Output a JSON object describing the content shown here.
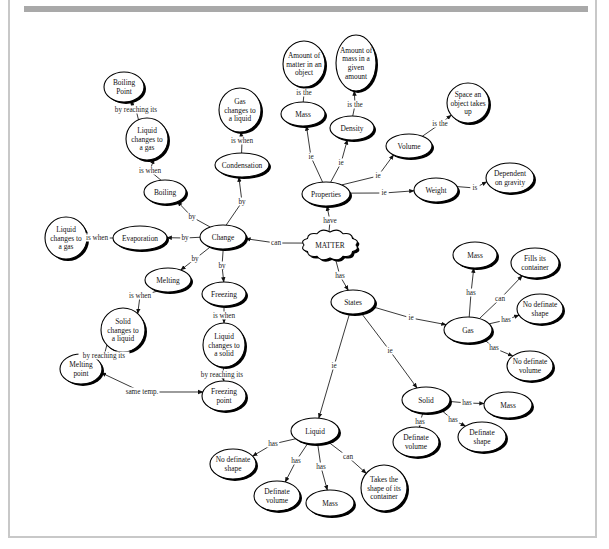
{
  "colors": {
    "frame": "#c8c8c8",
    "topbar": "#a9a9a9",
    "ink": "#111111"
  },
  "nodes": [
    {
      "id": "matter",
      "label": [
        "MATTER"
      ],
      "x": 330,
      "y": 245,
      "rx": 26,
      "ry": 13,
      "shape": "cloud"
    },
    {
      "id": "properties",
      "label": [
        "Properties"
      ],
      "x": 326,
      "y": 194,
      "rx": 24,
      "ry": 12
    },
    {
      "id": "mass_p",
      "label": [
        "Mass"
      ],
      "x": 303,
      "y": 114,
      "rx": 22,
      "ry": 12
    },
    {
      "id": "mass_def",
      "label": [
        "Amount of",
        "matter in an",
        "object"
      ],
      "x": 304,
      "y": 64,
      "rx": 21,
      "ry": 23
    },
    {
      "id": "density",
      "label": [
        "Density"
      ],
      "x": 352,
      "y": 128,
      "rx": 22,
      "ry": 12
    },
    {
      "id": "density_def",
      "label": [
        "Amount of",
        "mass in a",
        "given",
        "amount"
      ],
      "x": 356,
      "y": 63,
      "rx": 20,
      "ry": 28
    },
    {
      "id": "volume",
      "label": [
        "Volume"
      ],
      "x": 409,
      "y": 146,
      "rx": 23,
      "ry": 12
    },
    {
      "id": "volume_def",
      "label": [
        "Space an",
        "object takes",
        "up"
      ],
      "x": 468,
      "y": 103,
      "rx": 21,
      "ry": 20
    },
    {
      "id": "weight",
      "label": [
        "Weight"
      ],
      "x": 436,
      "y": 190,
      "rx": 22,
      "ry": 12
    },
    {
      "id": "weight_def",
      "label": [
        "Dependent",
        "on gravity"
      ],
      "x": 510,
      "y": 178,
      "rx": 24,
      "ry": 15
    },
    {
      "id": "change",
      "label": [
        "Change"
      ],
      "x": 223,
      "y": 237,
      "rx": 23,
      "ry": 12
    },
    {
      "id": "condensation",
      "label": [
        "Condensation"
      ],
      "x": 242,
      "y": 165,
      "rx": 27,
      "ry": 12
    },
    {
      "id": "cond_def",
      "label": [
        "Gas",
        "changes to",
        "a liquid"
      ],
      "x": 240,
      "y": 110,
      "rx": 21,
      "ry": 22
    },
    {
      "id": "boiling",
      "label": [
        "Boiling"
      ],
      "x": 165,
      "y": 192,
      "rx": 21,
      "ry": 12
    },
    {
      "id": "boil_def",
      "label": [
        "Liquid",
        "changes to",
        "a gas"
      ],
      "x": 147,
      "y": 139,
      "rx": 21,
      "ry": 21
    },
    {
      "id": "boiling_point",
      "label": [
        "Boiling",
        "Point"
      ],
      "x": 124,
      "y": 87,
      "rx": 20,
      "ry": 15
    },
    {
      "id": "evaporation",
      "label": [
        "Evaporation"
      ],
      "x": 140,
      "y": 238,
      "rx": 27,
      "ry": 12
    },
    {
      "id": "evap_def",
      "label": [
        "Liquid",
        "changes to",
        "a gas"
      ],
      "x": 66,
      "y": 238,
      "rx": 21,
      "ry": 21
    },
    {
      "id": "melting",
      "label": [
        "Melting"
      ],
      "x": 168,
      "y": 280,
      "rx": 23,
      "ry": 12
    },
    {
      "id": "melt_def",
      "label": [
        "Solid",
        "changes to",
        "a liquid"
      ],
      "x": 123,
      "y": 330,
      "rx": 22,
      "ry": 22
    },
    {
      "id": "melting_point",
      "label": [
        "Melting",
        "point"
      ],
      "x": 81,
      "y": 369,
      "rx": 21,
      "ry": 15
    },
    {
      "id": "freezing",
      "label": [
        "Freezing"
      ],
      "x": 224,
      "y": 294,
      "rx": 22,
      "ry": 12
    },
    {
      "id": "freeze_def",
      "label": [
        "Liquid",
        "changes to",
        "a solid"
      ],
      "x": 224,
      "y": 345,
      "rx": 21,
      "ry": 22
    },
    {
      "id": "freezing_point",
      "label": [
        "Freezing",
        "point"
      ],
      "x": 224,
      "y": 396,
      "rx": 22,
      "ry": 15
    },
    {
      "id": "states",
      "label": [
        "States"
      ],
      "x": 353,
      "y": 302,
      "rx": 22,
      "ry": 12
    },
    {
      "id": "gas",
      "label": [
        "Gas"
      ],
      "x": 468,
      "y": 330,
      "rx": 24,
      "ry": 13
    },
    {
      "id": "gas_mass",
      "label": [
        "Mass"
      ],
      "x": 475,
      "y": 255,
      "rx": 22,
      "ry": 13
    },
    {
      "id": "gas_fills",
      "label": [
        "Fills its",
        "container"
      ],
      "x": 535,
      "y": 263,
      "rx": 24,
      "ry": 15
    },
    {
      "id": "gas_shape",
      "label": [
        "No definate",
        "shape"
      ],
      "x": 540,
      "y": 309,
      "rx": 23,
      "ry": 15
    },
    {
      "id": "gas_volume",
      "label": [
        "No definate",
        "volume"
      ],
      "x": 530,
      "y": 366,
      "rx": 23,
      "ry": 15
    },
    {
      "id": "solid",
      "label": [
        "Solid"
      ],
      "x": 426,
      "y": 400,
      "rx": 24,
      "ry": 13
    },
    {
      "id": "solid_mass",
      "label": [
        "Mass"
      ],
      "x": 508,
      "y": 405,
      "rx": 24,
      "ry": 13
    },
    {
      "id": "solid_shape",
      "label": [
        "Definate",
        "shape"
      ],
      "x": 482,
      "y": 437,
      "rx": 24,
      "ry": 15
    },
    {
      "id": "solid_volume",
      "label": [
        "Definate",
        "volume"
      ],
      "x": 416,
      "y": 442,
      "rx": 23,
      "ry": 15
    },
    {
      "id": "liquid",
      "label": [
        "Liquid"
      ],
      "x": 315,
      "y": 431,
      "rx": 24,
      "ry": 13
    },
    {
      "id": "liq_shape",
      "label": [
        "No definate",
        "shape"
      ],
      "x": 233,
      "y": 464,
      "rx": 23,
      "ry": 15
    },
    {
      "id": "liq_volume",
      "label": [
        "Definate",
        "volume"
      ],
      "x": 277,
      "y": 496,
      "rx": 23,
      "ry": 15
    },
    {
      "id": "liq_mass",
      "label": [
        "Mass"
      ],
      "x": 330,
      "y": 503,
      "rx": 24,
      "ry": 13
    },
    {
      "id": "liq_container",
      "label": [
        "Takes the",
        "shape of its",
        "container"
      ],
      "x": 384,
      "y": 488,
      "rx": 23,
      "ry": 23
    }
  ],
  "edges": [
    {
      "from": "matter",
      "to": "properties",
      "label": "have",
      "lx": 330,
      "ly": 221
    },
    {
      "from": "matter",
      "to": "change",
      "label": "can",
      "lx": 276,
      "ly": 243
    },
    {
      "from": "matter",
      "to": "states",
      "label": "has",
      "lx": 340,
      "ly": 276
    },
    {
      "from": "properties",
      "to": "mass_p",
      "label": "ie",
      "lx": 311,
      "ly": 157
    },
    {
      "from": "properties",
      "to": "density",
      "label": "ie",
      "lx": 341,
      "ly": 163
    },
    {
      "from": "properties",
      "to": "volume",
      "label": "ie",
      "lx": 378,
      "ly": 176
    },
    {
      "from": "properties",
      "to": "weight",
      "label": "ie",
      "lx": 384,
      "ly": 193
    },
    {
      "from": "mass_p",
      "to": "mass_def",
      "label": "is the",
      "lx": 304,
      "ly": 93
    },
    {
      "from": "density",
      "to": "density_def",
      "label": "is the",
      "lx": 355,
      "ly": 105
    },
    {
      "from": "volume",
      "to": "volume_def",
      "label": "is the",
      "lx": 440,
      "ly": 124
    },
    {
      "from": "weight",
      "to": "weight_def",
      "label": "is",
      "lx": 475,
      "ly": 188
    },
    {
      "from": "change",
      "to": "condensation",
      "label": "by",
      "lx": 242,
      "ly": 202
    },
    {
      "from": "change",
      "to": "boiling",
      "label": "by",
      "lx": 192,
      "ly": 217
    },
    {
      "from": "change",
      "to": "evaporation",
      "label": "by",
      "lx": 185,
      "ly": 238
    },
    {
      "from": "change",
      "to": "melting",
      "label": "by",
      "lx": 195,
      "ly": 259
    },
    {
      "from": "change",
      "to": "freezing",
      "label": "by",
      "lx": 222,
      "ly": 266
    },
    {
      "from": "condensation",
      "to": "cond_def",
      "label": "is when",
      "lx": 242,
      "ly": 141
    },
    {
      "from": "boiling",
      "to": "boil_def",
      "label": "is when",
      "lx": 150,
      "ly": 171
    },
    {
      "from": "boil_def",
      "to": "boiling_point",
      "label": "by reaching its",
      "lx": 136,
      "ly": 110
    },
    {
      "from": "evaporation",
      "to": "evap_def",
      "label": "is when",
      "lx": 97,
      "ly": 238
    },
    {
      "from": "melting",
      "to": "melt_def",
      "label": "is when",
      "lx": 140,
      "ly": 296
    },
    {
      "from": "melt_def",
      "to": "melting_point",
      "label": "by reaching its",
      "lx": 104,
      "ly": 356
    },
    {
      "from": "freezing",
      "to": "freeze_def",
      "label": "is when",
      "lx": 224,
      "ly": 316
    },
    {
      "from": "freeze_def",
      "to": "freezing_point",
      "label": "by reaching its",
      "lx": 222,
      "ly": 375
    },
    {
      "from": "melting_point",
      "to": "freezing_point",
      "label": "same temp.",
      "lx": 142,
      "ly": 392,
      "both": true
    },
    {
      "from": "states",
      "to": "gas",
      "label": "ie",
      "lx": 411,
      "ly": 318
    },
    {
      "from": "states",
      "to": "solid",
      "label": "ie",
      "lx": 390,
      "ly": 351
    },
    {
      "from": "states",
      "to": "liquid",
      "label": "ie",
      "lx": 334,
      "ly": 366
    },
    {
      "from": "gas",
      "to": "gas_mass",
      "label": "has",
      "lx": 471,
      "ly": 293
    },
    {
      "from": "gas",
      "to": "gas_fills",
      "label": "can",
      "lx": 500,
      "ly": 299
    },
    {
      "from": "gas",
      "to": "gas_shape",
      "label": "has",
      "lx": 506,
      "ly": 320
    },
    {
      "from": "gas",
      "to": "gas_volume",
      "label": "has",
      "lx": 494,
      "ly": 348
    },
    {
      "from": "solid",
      "to": "solid_mass",
      "label": "has",
      "lx": 467,
      "ly": 403
    },
    {
      "from": "solid",
      "to": "solid_shape",
      "label": "has",
      "lx": 453,
      "ly": 420
    },
    {
      "from": "solid",
      "to": "solid_volume",
      "label": "has",
      "lx": 420,
      "ly": 422
    },
    {
      "from": "liquid",
      "to": "liq_shape",
      "label": "has",
      "lx": 273,
      "ly": 444
    },
    {
      "from": "liquid",
      "to": "liq_volume",
      "label": "has",
      "lx": 296,
      "ly": 461
    },
    {
      "from": "liquid",
      "to": "liq_mass",
      "label": "has",
      "lx": 321,
      "ly": 467
    },
    {
      "from": "liquid",
      "to": "liq_container",
      "label": "can",
      "lx": 348,
      "ly": 457
    }
  ]
}
